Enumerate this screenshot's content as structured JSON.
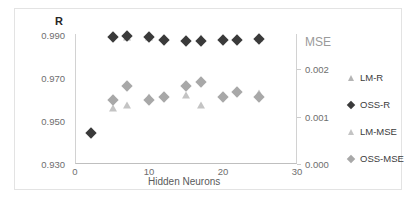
{
  "chart_data": {
    "type": "scatter",
    "title": "",
    "xlabel": "Hidden Neurons",
    "ylabel": "R",
    "y2label": "MSE",
    "xlim": [
      0,
      30
    ],
    "ylim": [
      0.93,
      0.99
    ],
    "y2lim": [
      0.0,
      0.002
    ],
    "grid": false,
    "legend_position": "right",
    "xticks": [
      "0",
      "10",
      "20",
      "30"
    ],
    "xtick_values": [
      0,
      10,
      20,
      30
    ],
    "yticks": [
      "0.930",
      "0.950",
      "0.970",
      "0.990"
    ],
    "ytick_values": [
      0.93,
      0.95,
      0.97,
      0.99
    ],
    "y2ticks": [
      "0.000",
      "0.001",
      "0.002"
    ],
    "y2tick_values": [
      0.0,
      0.001,
      0.002
    ],
    "x": [
      2,
      5,
      7,
      10,
      12,
      15,
      17,
      20,
      22,
      25
    ],
    "series": [
      {
        "name": "LM-R",
        "axis": "left",
        "marker": "triangle",
        "color": "#b5b5b5",
        "values": [
          null,
          null,
          0.9888,
          0.9885,
          null,
          null,
          0.9883,
          null,
          null,
          0.988
        ]
      },
      {
        "name": "OSS-R",
        "axis": "left",
        "marker": "diamond",
        "color": "#3a3a3a",
        "values": [
          0.944,
          0.9888,
          0.9893,
          0.9888,
          0.9873,
          0.9868,
          0.9866,
          0.9873,
          0.9871,
          0.9875
        ]
      },
      {
        "name": "LM-MSE",
        "axis": "right",
        "marker": "triangle",
        "color": "#c4c4c4",
        "values": [
          null,
          0.00085,
          0.0009,
          0.00103,
          null,
          0.00106,
          0.0009,
          null,
          null,
          0.00108
        ]
      },
      {
        "name": "OSS-MSE",
        "axis": "right",
        "marker": "diamond",
        "color": "#a8a8a8",
        "values": [
          null,
          0.00098,
          0.0012,
          0.00098,
          0.00103,
          0.0012,
          0.00125,
          0.00103,
          0.0011,
          0.00103
        ]
      }
    ]
  },
  "axes": {
    "left_title": "R",
    "right_title": "MSE",
    "x_title": "Hidden Neurons"
  },
  "legend": {
    "items": [
      {
        "label": "LM-R",
        "marker": "triangle",
        "color": "#b5b5b5"
      },
      {
        "label": "OSS-R",
        "marker": "diamond",
        "color": "#3a3a3a"
      },
      {
        "label": "LM-MSE",
        "marker": "triangle",
        "color": "#c4c4c4"
      },
      {
        "label": "OSS-MSE",
        "marker": "diamond",
        "color": "#a8a8a8"
      }
    ]
  }
}
